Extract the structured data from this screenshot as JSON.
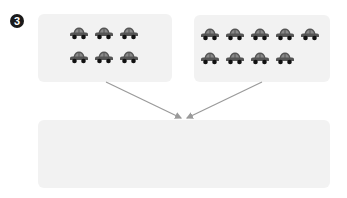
{
  "problem": {
    "number": "3"
  },
  "groups": [
    {
      "name": "left-group",
      "rows": [
        3,
        3
      ],
      "total": 6,
      "icon": "car-icon"
    },
    {
      "name": "right-group",
      "rows": [
        5,
        4
      ],
      "total": 9,
      "icon": "car-icon"
    }
  ],
  "answer_box": {
    "value": ""
  },
  "colors": {
    "box_bg": "#f2f2f2",
    "car_body": "#555555",
    "car_window": "#8a8a8a",
    "wheel": "#111111",
    "arrow": "#9a9a9a",
    "badge": "#1a1a1a"
  }
}
